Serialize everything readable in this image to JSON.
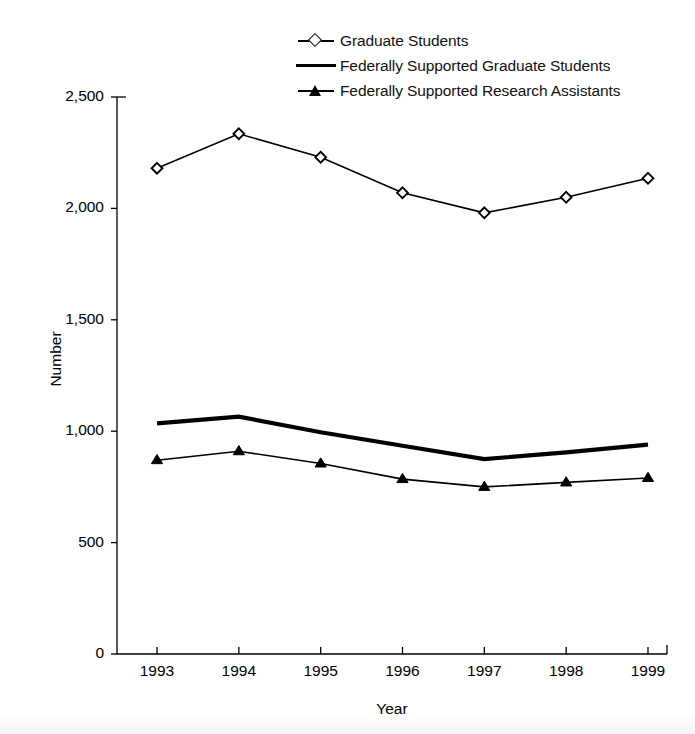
{
  "chart_data": {
    "type": "line",
    "title": "",
    "xlabel": "Year",
    "ylabel": "Number",
    "categories": [
      "1993",
      "1994",
      "1995",
      "1996",
      "1997",
      "1998",
      "1999"
    ],
    "x": [
      1993,
      1994,
      1995,
      1996,
      1997,
      1998,
      1999
    ],
    "xlim": [
      1993,
      1999
    ],
    "ylim": [
      0,
      2500
    ],
    "yticks": [
      0,
      500,
      1000,
      1500,
      2000,
      2500
    ],
    "ytick_labels": [
      "0",
      "500",
      "1,000",
      "1,500",
      "2,000",
      "2,500"
    ],
    "grid": false,
    "legend_position": "top-center",
    "series": [
      {
        "name": "Graduate Students",
        "marker": "open-diamond",
        "line_width": "thin",
        "color": "#000000",
        "values": [
          2180,
          2335,
          2230,
          2070,
          1980,
          2050,
          2135
        ]
      },
      {
        "name": "Federally Supported Graduate Students",
        "marker": "none",
        "line_width": "thick",
        "color": "#000000",
        "values": [
          1035,
          1065,
          995,
          935,
          875,
          905,
          940
        ]
      },
      {
        "name": "Federally Supported Research Assistants",
        "marker": "filled-triangle",
        "line_width": "thin",
        "color": "#000000",
        "values": [
          870,
          910,
          855,
          785,
          750,
          770,
          790
        ]
      }
    ]
  },
  "legend": {
    "items": [
      {
        "label": "Graduate Students",
        "key": "open-diamond-line-icon"
      },
      {
        "label": "Federally Supported Graduate Students",
        "key": "thick-line-icon"
      },
      {
        "label": "Federally Supported Research Assistants",
        "key": "filled-triangle-line-icon"
      }
    ]
  },
  "axes": {
    "y_title": "Number",
    "x_title": "Year",
    "y_tick_labels": [
      "2,500",
      "2,000",
      "1,500",
      "1,000",
      "500",
      "0"
    ],
    "x_tick_labels": [
      "1993",
      "1994",
      "1995",
      "1996",
      "1997",
      "1998",
      "1999"
    ]
  }
}
